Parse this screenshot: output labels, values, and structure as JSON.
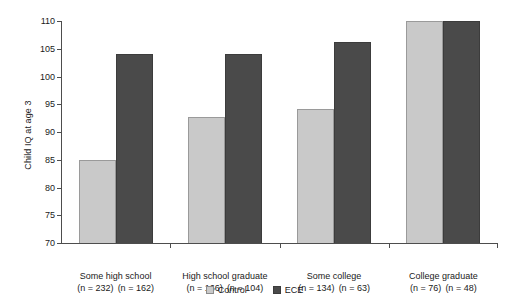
{
  "chart_data": {
    "type": "bar",
    "title": "",
    "xlabel": "",
    "ylabel": "Child IQ at age 3",
    "ylim": [
      70,
      110
    ],
    "ytick_step": 5,
    "yticks": [
      "110",
      "105",
      "100",
      "95",
      "90",
      "85",
      "80",
      "75",
      "70"
    ],
    "grid": false,
    "legend_position": "bottom-center",
    "categories": [
      "Some high school",
      "High school graduate",
      "Some college",
      "College graduate"
    ],
    "series": [
      {
        "name": "Control",
        "color": "#c9c9c9",
        "values": [
          85.0,
          92.7,
          94.2,
          110.0
        ]
      },
      {
        "name": "ECE",
        "color": "#4a4a4a",
        "values": [
          104.0,
          104.0,
          106.3,
          110.0
        ]
      }
    ],
    "sample_sizes": [
      {
        "control": "(n = 232)",
        "ece": "(n = 162)"
      },
      {
        "control": "(n = 166)",
        "ece": "(n = 104)"
      },
      {
        "control": "(n = 134)",
        "ece": "(n = 63)"
      },
      {
        "control": "(n = 76)",
        "ece": "(n = 48)"
      }
    ]
  },
  "legend": {
    "items": [
      {
        "label": "Control",
        "swatch": "light-gray-swatch-icon"
      },
      {
        "label": "ECE",
        "swatch": "dark-gray-swatch-icon"
      }
    ]
  },
  "colors": {
    "control": "#c9c9c9",
    "ece": "#4a4a4a",
    "axis": "#4d4d4d",
    "text": "#1a1a1a",
    "background": "#ffffff"
  }
}
